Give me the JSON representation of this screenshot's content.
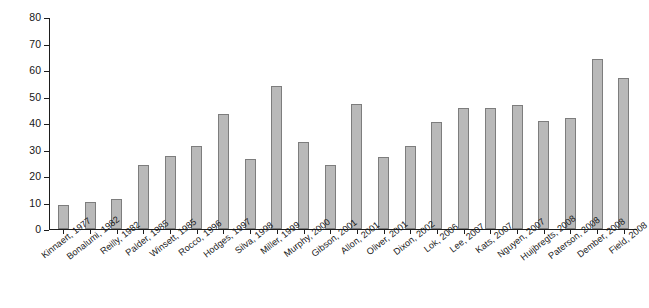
{
  "chart_data": {
    "type": "bar",
    "title": "",
    "xlabel": "",
    "ylabel": "Percent maturation failure",
    "ylim": [
      0,
      80
    ],
    "ytick_labels": [
      "80",
      "70",
      "60",
      "50",
      "40",
      "30",
      "20",
      "10",
      "0"
    ],
    "ytick_values": [
      80,
      70,
      60,
      50,
      40,
      30,
      20,
      10,
      0
    ],
    "grid": false,
    "legend": "none",
    "bar_color": "#b9b9b9",
    "bar_border_color": "#7d7d7d",
    "axis_color": "#1d1d1d",
    "categories": [
      "Kinnaert, 1977",
      "Bonalumi, 1982",
      "Reilly, 1982",
      "Palder, 1985",
      "Winsett, 1985",
      "Rocco, 1996",
      "Hodges, 1997",
      "Silva, 1998",
      "Miller, 1999",
      "Murphy, 2000",
      "Gibson, 2001",
      "Allon, 2001",
      "Oliver, 2001",
      "Dixon, 2002",
      "Lok, 2006",
      "Lee, 2007",
      "Kats, 2007",
      "Nguyen, 2007",
      "Huijbregts, 2008",
      "Paterson, 2008",
      "Dember, 2008",
      "Field, 2008"
    ],
    "values": [
      9,
      10.1,
      11.3,
      24.3,
      27.4,
      31.5,
      43.5,
      26.6,
      53.8,
      33,
      24,
      47.2,
      27.3,
      31.2,
      40.4,
      45.5,
      45.5,
      46.7,
      40.7,
      41.8,
      64.2,
      57.1
    ]
  }
}
